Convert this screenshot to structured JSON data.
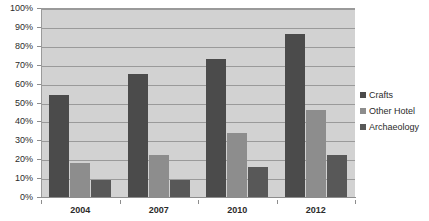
{
  "chart_data": {
    "type": "bar",
    "title": "",
    "subtitle": "",
    "xlabel": "",
    "ylabel": "",
    "categories": [
      "2004",
      "2007",
      "2010",
      "2012"
    ],
    "series": [
      {
        "name": "Crafts",
        "color": "#4b4b4b",
        "values": [
          54,
          65,
          73,
          86
        ]
      },
      {
        "name": "Other Hotel",
        "color": "#8d8d8d",
        "values": [
          18,
          22,
          34,
          46
        ]
      },
      {
        "name": "Archaeology",
        "color": "#585858",
        "values": [
          9,
          9,
          16,
          22
        ]
      }
    ],
    "ylim": [
      0,
      100
    ],
    "y_tick_labels": [
      "0%",
      "10%",
      "20%",
      "30%",
      "40%",
      "50%",
      "60%",
      "70%",
      "80%",
      "90%",
      "100%"
    ],
    "y_tick_values": [
      0,
      10,
      20,
      30,
      40,
      50,
      60,
      70,
      80,
      90,
      100
    ],
    "grid": true,
    "legend_position": "right",
    "plot_background": "#d2d2d2",
    "grid_color": "#9a9a9a"
  }
}
